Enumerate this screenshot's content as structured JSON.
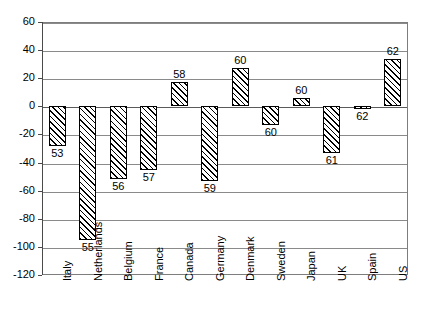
{
  "chart_data": {
    "type": "bar",
    "title": "",
    "subtitle": "",
    "xlabel": "",
    "ylabel": "",
    "ylim": [
      -120,
      60
    ],
    "ytick_step": 20,
    "grid": true,
    "legend": null,
    "categories": [
      "Italy",
      "Netherlands",
      "Belgium",
      "France",
      "Canada",
      "Germany",
      "Denmark",
      "Sweden",
      "Japan",
      "UK",
      "Spain",
      "US"
    ],
    "values": [
      -28,
      -95,
      -52,
      -45,
      17,
      -53,
      27,
      -13,
      6,
      -33,
      -2,
      34
    ],
    "point_labels": [
      "53",
      "55",
      "56",
      "57",
      "58",
      "59",
      "60",
      "60",
      "60",
      "61",
      "62",
      "62"
    ],
    "ytick_labels": [
      "60",
      "40",
      "20",
      "0",
      "-20",
      "-40",
      "-60",
      "-80",
      "-100",
      "-120"
    ],
    "ytick_values": [
      60,
      40,
      20,
      0,
      -20,
      -40,
      -60,
      -80,
      -100,
      -120
    ]
  }
}
